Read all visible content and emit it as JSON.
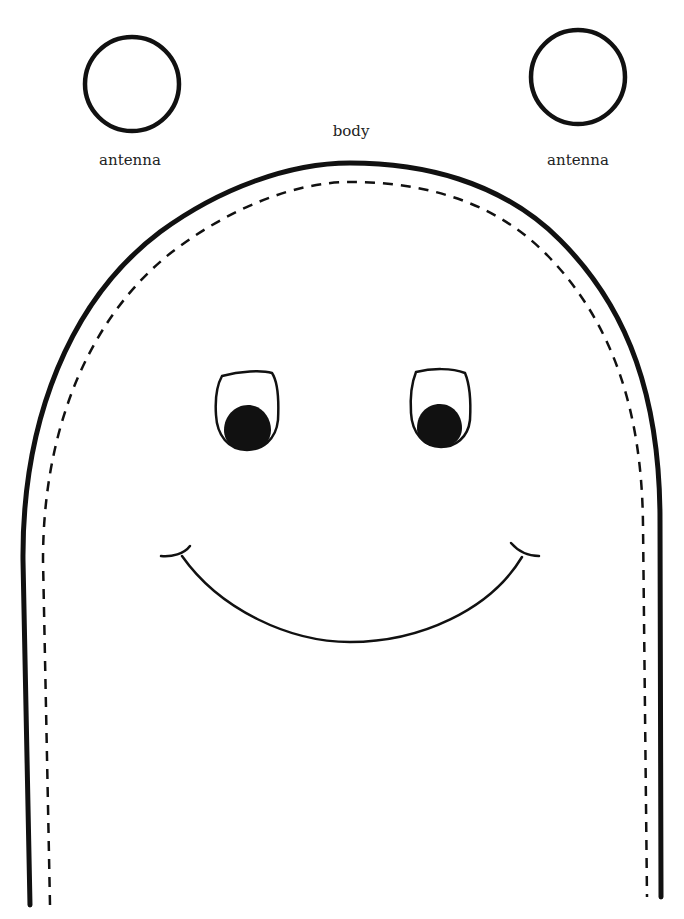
{
  "template": {
    "title": "Finger puppet cutout pattern",
    "labels": {
      "antenna_left": "antenna",
      "antenna_right": "antenna",
      "body": "body"
    },
    "parts": [
      {
        "name": "antenna",
        "count": 2,
        "shape": "circle-outline"
      },
      {
        "name": "body",
        "shape": "arch",
        "outline": "solid",
        "fold_or_stitch_line": "dashed"
      },
      {
        "name": "eyes",
        "count": 2,
        "pupil": "filled-bottom"
      },
      {
        "name": "smile",
        "shape": "curve-with-end-ticks"
      }
    ],
    "colors": {
      "ink": "#111111",
      "paper": "#ffffff"
    }
  }
}
